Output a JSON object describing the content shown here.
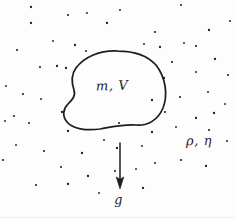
{
  "figure": {
    "kind": "hand-drawn-physics-diagram",
    "width": 235,
    "height": 218,
    "background_color": "#fdfdfd",
    "ink_color": "#1d1d1d"
  },
  "labels": {
    "body": "m, V",
    "fluid": "ρ, η",
    "gravity": "g"
  },
  "chart_data": {
    "type": "scatter",
    "title": "",
    "xlabel": "",
    "ylabel": "",
    "xlim": [
      0,
      235
    ],
    "ylim": [
      0,
      218
    ],
    "grid": false,
    "legend": "none",
    "annotations": [
      {
        "text": "m, V",
        "x": 104,
        "y": 88
      },
      {
        "text": "ρ, η",
        "x": 196,
        "y": 142
      },
      {
        "text": "g",
        "x": 120,
        "y": 200
      }
    ],
    "series": [
      {
        "name": "fluid-particles",
        "marker": "dot",
        "color": "#1d1d1d",
        "points": [
          [
            31,
            7
          ],
          [
            87,
            13
          ],
          [
            68,
            15
          ],
          [
            107,
            23
          ],
          [
            120,
            10
          ],
          [
            181,
            5
          ],
          [
            209,
            30
          ],
          [
            230,
            21
          ],
          [
            155,
            32
          ],
          [
            31,
            23
          ],
          [
            53,
            41
          ],
          [
            17,
            50
          ],
          [
            75,
            45
          ],
          [
            86,
            51
          ],
          [
            40,
            67
          ],
          [
            57,
            66
          ],
          [
            6,
            86
          ],
          [
            23,
            94
          ],
          [
            66,
            68
          ],
          [
            41,
            99
          ],
          [
            14,
            116
          ],
          [
            62,
            112
          ],
          [
            184,
            43
          ],
          [
            196,
            46
          ],
          [
            160,
            47
          ],
          [
            144,
            44
          ],
          [
            172,
            62
          ],
          [
            215,
            59
          ],
          [
            196,
            72
          ],
          [
            228,
            75
          ],
          [
            164,
            78
          ],
          [
            208,
            92
          ],
          [
            180,
            97
          ],
          [
            152,
            100
          ],
          [
            225,
            104
          ],
          [
            165,
            112
          ],
          [
            196,
            118
          ],
          [
            5,
            121
          ],
          [
            29,
            123
          ],
          [
            68,
            131
          ],
          [
            16,
            145
          ],
          [
            44,
            151
          ],
          [
            82,
            153
          ],
          [
            104,
            140
          ],
          [
            119,
            123
          ],
          [
            152,
            132
          ],
          [
            176,
            127
          ],
          [
            209,
            130
          ],
          [
            117,
            148
          ],
          [
            142,
            146
          ],
          [
            36,
            185
          ],
          [
            68,
            184
          ],
          [
            155,
            163
          ],
          [
            181,
            160
          ],
          [
            206,
            166
          ],
          [
            136,
            169
          ],
          [
            115,
            171
          ],
          [
            143,
            188
          ],
          [
            99,
            193
          ],
          [
            61,
            167
          ],
          [
            88,
            176
          ],
          [
            227,
            141
          ],
          [
            3,
            160
          ],
          [
            214,
            113
          ]
        ]
      }
    ],
    "shapes": [
      {
        "name": "body-outline",
        "type": "closed-curve",
        "fill": "none",
        "stroke": "#1d1d1d",
        "stroke_width": 1.7
      },
      {
        "name": "gravity-arrow",
        "type": "arrow",
        "from": [
          120,
          143
        ],
        "to": [
          120,
          188
        ],
        "direction": "down",
        "stroke": "#1d1d1d",
        "stroke_width": 1.4
      }
    ]
  }
}
